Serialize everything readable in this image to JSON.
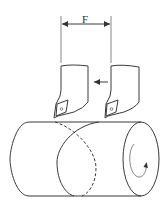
{
  "diagram": {
    "dimension_label": "F",
    "elements": {
      "dimension": {
        "label": "F",
        "meaning": "feed / pitch distance between tool positions"
      },
      "tools": [
        {
          "id": "tool-left",
          "description": "cutting tool, initial position"
        },
        {
          "id": "tool-right",
          "description": "cutting tool, advanced position"
        }
      ],
      "feed_arrow": {
        "direction": "left"
      },
      "workpiece": {
        "shape": "cylinder",
        "rotation_arrow": "clockwise spiral on end face"
      },
      "helix": {
        "visible": "solid front curve",
        "hidden": "dashed back curve"
      }
    },
    "colors": {
      "line": "#3a3a3a",
      "background": "#ffffff"
    }
  }
}
